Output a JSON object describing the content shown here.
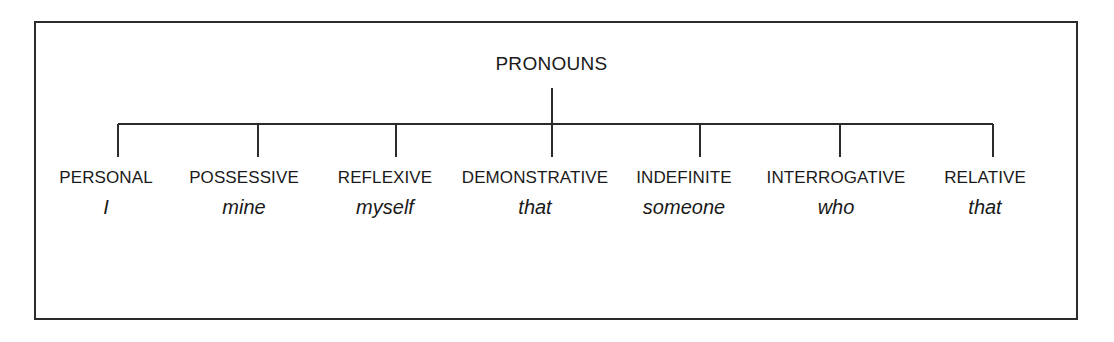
{
  "figure": {
    "kind": "tree-diagram",
    "root": {
      "label": "PRONOUNS"
    },
    "leaves": [
      {
        "label": "PERSONAL",
        "example": "I",
        "center_x": 106,
        "tick_x": 118
      },
      {
        "label": "POSSESSIVE",
        "example": "mine",
        "center_x": 244,
        "tick_x": 258
      },
      {
        "label": "REFLEXIVE",
        "example": "myself",
        "center_x": 385,
        "tick_x": 396
      },
      {
        "label": "DEMONSTRATIVE",
        "example": "that",
        "center_x": 535,
        "tick_x": 552
      },
      {
        "label": "INDEFINITE",
        "example": "someone",
        "center_x": 684,
        "tick_x": 700
      },
      {
        "label": "INTERROGATIVE",
        "example": "who",
        "center_x": 836,
        "tick_x": 840
      },
      {
        "label": "RELATIVE",
        "example": "that",
        "center_x": 985,
        "tick_x": 993
      }
    ],
    "geometry": {
      "root_stem_top_y": 88,
      "connector_y": 124,
      "connector_x_start": 118,
      "connector_x_end": 993,
      "tick_bottom_y": 157,
      "label_y": 168,
      "example_y": 197
    },
    "colors": {
      "line": "#2b2b2b",
      "text": "#1a1a1a",
      "background": "#ffffff",
      "border": "#2b2b2b"
    }
  }
}
